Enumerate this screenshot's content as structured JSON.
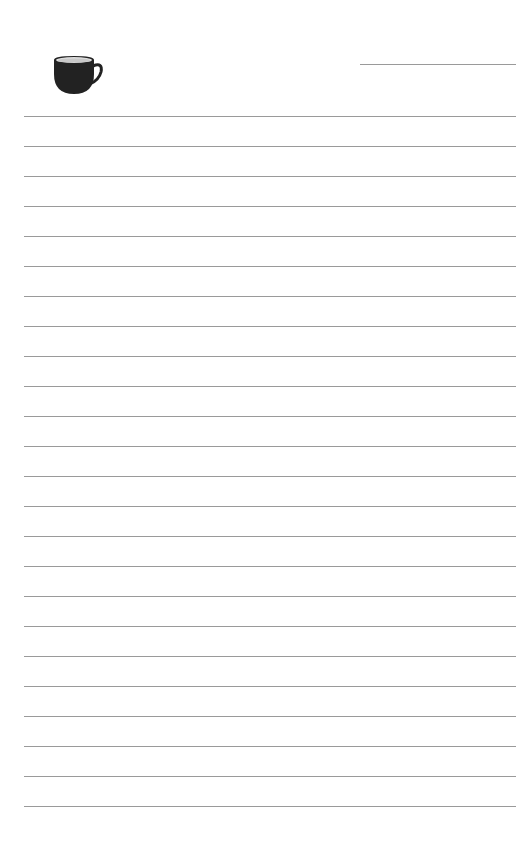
{
  "page": {
    "type": "lined-notepad",
    "icon": "coffee-cup-icon",
    "colors": {
      "background": "#ffffff",
      "rule": "#9a9a9a",
      "cup": "#222222"
    },
    "title_line": {
      "value": ""
    },
    "lines": [
      "",
      "",
      "",
      "",
      "",
      "",
      "",
      "",
      "",
      "",
      "",
      "",
      "",
      "",
      "",
      "",
      "",
      "",
      "",
      "",
      "",
      "",
      "",
      ""
    ]
  }
}
